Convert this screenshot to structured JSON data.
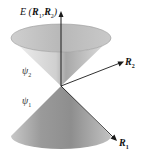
{
  "diagram": {
    "energy_axis": {
      "label_prefix": "E",
      "label_open": "(",
      "var1": "R",
      "var1_sub": "1",
      "sep": ",",
      "var2": "R",
      "var2_sub": "2",
      "label_close": ")"
    },
    "axis_r2": {
      "symbol": "R",
      "sub": "2"
    },
    "axis_r1": {
      "symbol": "R",
      "sub": "1"
    },
    "upper_surface": {
      "symbol": "ψ",
      "sub": "2"
    },
    "lower_surface": {
      "symbol": "ψ",
      "sub": "1"
    },
    "colors": {
      "cone_light": "#e6e6e6",
      "cone_mid": "#b5b5b5",
      "cone_dark": "#8a8a8a",
      "axis": "#1a1a1a",
      "background": "#ffffff"
    }
  }
}
